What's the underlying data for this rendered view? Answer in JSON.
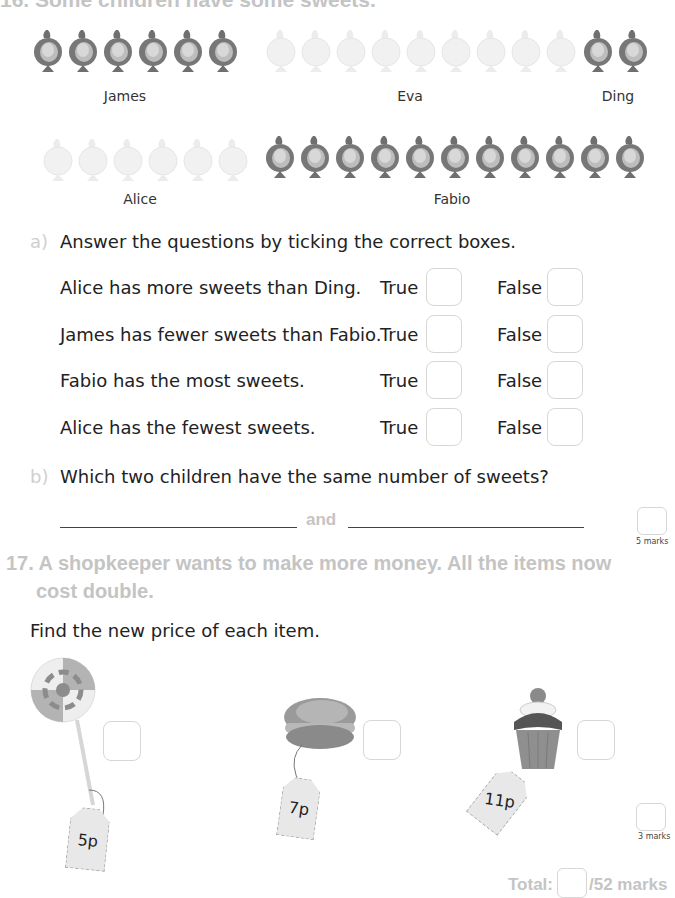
{
  "q16": {
    "heading": "16. Some children have some sweets.",
    "children": [
      {
        "name": "James",
        "count": 6,
        "shade": "dark"
      },
      {
        "name": "Eva",
        "count": 9,
        "shade": "light"
      },
      {
        "name": "Ding",
        "count": 2,
        "shade": "dark"
      },
      {
        "name": "Alice",
        "count": 6,
        "shade": "light"
      },
      {
        "name": "Fabio",
        "count": 11,
        "shade": "dark"
      }
    ],
    "part_a": {
      "letter": "a)",
      "instruction": "Answer the questions by ticking the correct boxes.",
      "true_label": "True",
      "false_label": "False",
      "statements": [
        "Alice has more sweets than Ding.",
        "James has fewer sweets than Fabio.",
        "Fabio has the most sweets.",
        "Alice has the fewest sweets."
      ]
    },
    "part_b": {
      "letter": "b)",
      "question": "Which two children have the same number of sweets?",
      "connector": "and"
    },
    "marks": "5 marks"
  },
  "q17": {
    "heading_line1": "17. A shopkeeper wants to make more money. All the items now",
    "heading_line2": "cost double.",
    "instruction": "Find the new price of each item.",
    "items": [
      {
        "name": "lollipop",
        "price": "5p"
      },
      {
        "name": "macaron",
        "price": "7p"
      },
      {
        "name": "cupcake",
        "price": "11p"
      }
    ],
    "marks": "3 marks"
  },
  "total": {
    "label": "Total:",
    "out_of": "/52 marks"
  },
  "colors": {
    "dark_sweet": "#7a7a7a",
    "light_sweet": "#efefef",
    "heading_gray": "#c4c4c4",
    "box_border": "#d6d6d6"
  }
}
